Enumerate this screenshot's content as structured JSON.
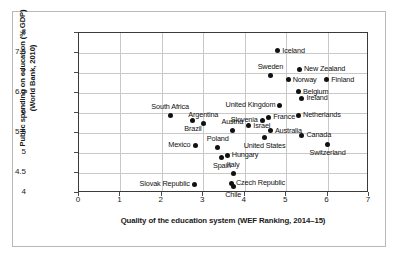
{
  "chart_data": {
    "type": "scatter",
    "title": "",
    "xlabel": "Quality of the education system (WEF Ranking, 2014–15)",
    "ylabel_line1": "Public spending on education (% GDP)",
    "ylabel_line2": "(World Bank, 2010)",
    "xlim": [
      0,
      7
    ],
    "ylim": [
      4,
      8
    ],
    "xticks": [
      0,
      1,
      2,
      3,
      4,
      5,
      6,
      7
    ],
    "yticks": [
      4,
      4.5,
      5,
      5.5,
      6,
      6.5,
      7,
      7.5,
      8
    ],
    "xtick_labels": [
      "0",
      "1",
      "2",
      "3",
      "4",
      "5",
      "6",
      "7"
    ],
    "ytick_labels": [
      "4",
      "4.5",
      "5",
      "5.5",
      "6",
      "6.5",
      "7",
      "7.5",
      "8"
    ],
    "grid": "horizontal-and-vertical",
    "legend": "none",
    "marker_color": "#111111",
    "points": [
      {
        "label": "Iceland",
        "x": 4.8,
        "y": 7.56,
        "pos": "right"
      },
      {
        "label": "Sweden",
        "x": 4.62,
        "y": 6.95,
        "pos": "above"
      },
      {
        "label": "New Zealand",
        "x": 5.32,
        "y": 7.1,
        "pos": "right"
      },
      {
        "label": "Norway",
        "x": 5.05,
        "y": 6.83,
        "pos": "right"
      },
      {
        "label": "Finland",
        "x": 5.98,
        "y": 6.83,
        "pos": "right"
      },
      {
        "label": "Belgium",
        "x": 5.3,
        "y": 6.53,
        "pos": "right"
      },
      {
        "label": "Ireland",
        "x": 5.38,
        "y": 6.37,
        "pos": "right"
      },
      {
        "label": "United Kingdom",
        "x": 4.85,
        "y": 6.2,
        "pos": "left"
      },
      {
        "label": "South Africa",
        "x": 2.2,
        "y": 5.93,
        "pos": "above"
      },
      {
        "label": "Netherlands",
        "x": 5.3,
        "y": 5.94,
        "pos": "right"
      },
      {
        "label": "Slovenia",
        "x": 4.42,
        "y": 5.82,
        "pos": "left"
      },
      {
        "label": "France",
        "x": 4.58,
        "y": 5.89,
        "pos": "right"
      },
      {
        "label": "Argentina",
        "x": 3.0,
        "y": 5.75,
        "pos": "above"
      },
      {
        "label": "Brazil",
        "x": 2.75,
        "y": 5.81,
        "pos": "below"
      },
      {
        "label": "Austria",
        "x": 3.7,
        "y": 5.57,
        "pos": "above"
      },
      {
        "label": "Israel",
        "x": 4.1,
        "y": 5.68,
        "pos": "right"
      },
      {
        "label": "Australia",
        "x": 4.62,
        "y": 5.56,
        "pos": "right"
      },
      {
        "label": "Canada",
        "x": 5.38,
        "y": 5.45,
        "pos": "right"
      },
      {
        "label": "United States",
        "x": 4.48,
        "y": 5.39,
        "pos": "below"
      },
      {
        "label": "Mexico",
        "x": 2.8,
        "y": 5.19,
        "pos": "left"
      },
      {
        "label": "Switzerland",
        "x": 6.0,
        "y": 5.21,
        "pos": "below"
      },
      {
        "label": "Poland",
        "x": 3.35,
        "y": 5.15,
        "pos": "above"
      },
      {
        "label": "Hungary",
        "x": 3.58,
        "y": 4.95,
        "pos": "right"
      },
      {
        "label": "Spain",
        "x": 3.45,
        "y": 4.88,
        "pos": "below"
      },
      {
        "label": "Italy",
        "x": 3.72,
        "y": 4.49,
        "pos": "above"
      },
      {
        "label": "Slovak Republic",
        "x": 2.78,
        "y": 4.22,
        "pos": "left"
      },
      {
        "label": "Czech Republic",
        "x": 3.68,
        "y": 4.24,
        "pos": "right"
      },
      {
        "label": "Chile",
        "x": 3.72,
        "y": 4.17,
        "pos": "below"
      }
    ]
  }
}
